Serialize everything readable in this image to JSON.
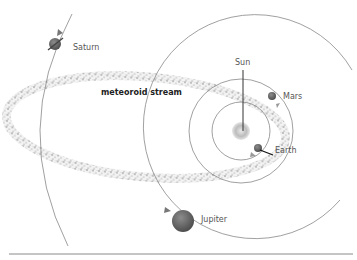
{
  "diagram": {
    "title": "",
    "labels": {
      "sun": "Sun",
      "earth": "Earth",
      "mars": "Mars",
      "jupiter": "Jupiter",
      "saturn": "Saturn",
      "stream": "meteoroid stream"
    },
    "colors": {
      "orbit": "#808080",
      "planet": "#6e6e6e",
      "sun": "#bdbdbd",
      "stream_dots": "#6a6a6a",
      "rule": "#8a8a8a",
      "label": "#555555"
    }
  }
}
